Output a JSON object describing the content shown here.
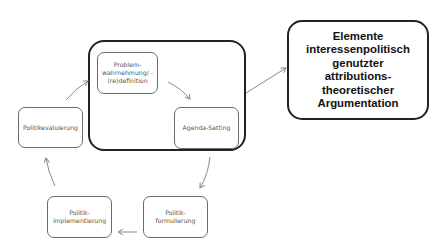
{
  "diagram": {
    "type": "policy-cycle",
    "highlight_frame": "first two stages (Problemwahrnehmung, Agenda-Setting) grouped",
    "stages": [
      {
        "id": "problem",
        "label": "Problem-\nwahrnehmung/ -\n(re)definition"
      },
      {
        "id": "agenda",
        "label": "Agenda-Setting"
      },
      {
        "id": "formulierung",
        "label": "Politik-\nformulierung"
      },
      {
        "id": "implementierung",
        "label": "Politik-\nimplementierung"
      },
      {
        "id": "evaluierung",
        "label": "Politikevaluierung"
      }
    ],
    "outcome": {
      "label": "Elemente\ninteressenpolitisch\ngenutzter\nattributions-\ntheoretischer\nArgumentation"
    },
    "edges": [
      {
        "from": "problem",
        "to": "agenda"
      },
      {
        "from": "agenda",
        "to": "formulierung"
      },
      {
        "from": "formulierung",
        "to": "implementierung"
      },
      {
        "from": "implementierung",
        "to": "evaluierung"
      },
      {
        "from": "evaluierung",
        "to": "problem"
      },
      {
        "from": "cycle-frame",
        "to": "outcome"
      }
    ],
    "colors": {
      "frame": "#222222",
      "stage_border": "#6b6b6b",
      "arrow": "#8a8a8a"
    }
  }
}
